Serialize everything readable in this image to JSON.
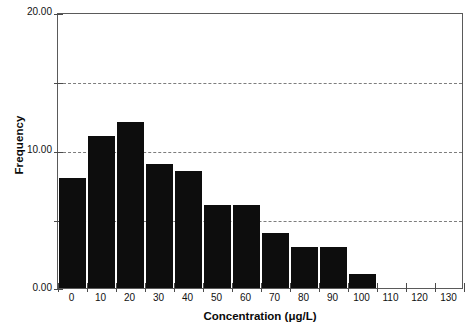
{
  "chart_data": {
    "type": "bar",
    "title": "",
    "subtitle": "",
    "xlabel": "Concentration (μg/L)",
    "ylabel": "Frequency",
    "categories": [
      0,
      10,
      20,
      30,
      40,
      50,
      60,
      70,
      80,
      90,
      100,
      110,
      120,
      130
    ],
    "xtick_labels": [
      "0",
      "10",
      "20",
      "30",
      "40",
      "50",
      "60",
      "70",
      "80",
      "90",
      "100",
      "110",
      "120",
      "130"
    ],
    "values": [
      8,
      11,
      12,
      9,
      8.5,
      6,
      6,
      4,
      3,
      3,
      1,
      0,
      0,
      0
    ],
    "bar_color": "#0d0d0d",
    "xlim": [
      -5,
      135
    ],
    "ylim": [
      0,
      20
    ],
    "yticks": [
      0,
      5,
      10,
      15,
      20
    ],
    "ytick_labels": [
      "0.00",
      "5.00",
      "10.00",
      "15.00",
      "20.00"
    ],
    "ytick_labels_shown": [
      "0.00",
      "",
      "10.00",
      "",
      "20.00"
    ],
    "grid": true,
    "grid_axis": "y",
    "grid_style": "dashed",
    "grid_color": "#7d7d7d",
    "legend": null,
    "bin_width": 10,
    "frame_color": "#5a5a5a",
    "background": "#ffffff"
  },
  "axis": {
    "y_title": "Frequency",
    "x_title": "Concentration (μg/L)"
  }
}
